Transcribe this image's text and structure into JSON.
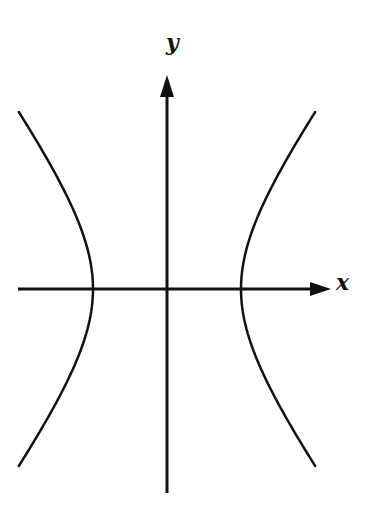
{
  "diagram": {
    "type": "hyperbola",
    "axes": {
      "x_label": "x",
      "y_label": "y"
    },
    "colors": {
      "stroke": "#111111",
      "background": "#ffffff"
    },
    "geometry": {
      "origin_px": [
        167,
        289
      ],
      "a_px": 74,
      "b_px": 102,
      "x_axis_range_px": [
        18,
        330
      ],
      "y_axis_range_px": [
        75,
        493
      ],
      "branch_y_extent_px": 177
    }
  }
}
